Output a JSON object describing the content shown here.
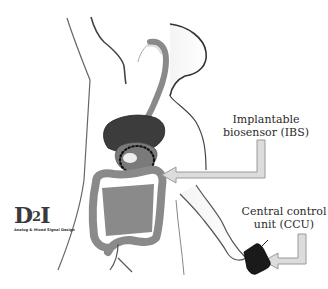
{
  "figure": {
    "type": "medical-illustration"
  },
  "labels": {
    "ibs": {
      "line1": "Implantable",
      "line2": "biosensor (IBS)"
    },
    "ccu": {
      "line1": "Central control",
      "line2": "unit (CCU)"
    }
  },
  "logo": {
    "main_prefix": "D",
    "main_sup": "2",
    "main_suffix": "I",
    "subtitle": "Analog & Mixed Signal Design"
  },
  "colors": {
    "background": "#ffffff",
    "body_outline": "#555555",
    "liver": "#3c3c3c",
    "intestine": "#8a8a8a",
    "arrow_fill": "#d8d8d8",
    "arrow_stroke": "#9a9a9a",
    "device": "#1a1a1a",
    "sensor_ring": "#111111"
  },
  "arrows": [
    {
      "name": "ibs-pointer",
      "from": "Implantable biosensor (IBS)",
      "to": "dotted sensor ring on stomach"
    },
    {
      "name": "ccu-pointer",
      "from": "Central control unit (CCU)",
      "to": "wrist device"
    }
  ]
}
